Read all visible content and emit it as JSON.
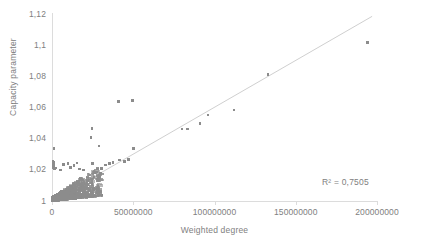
{
  "chart_data": {
    "type": "scatter",
    "title": "",
    "xlabel": "Weighted degree",
    "ylabel": "Capacity parameter",
    "xlim": [
      0,
      200000000
    ],
    "ylim": [
      1,
      1.12
    ],
    "grid": false,
    "legend": null,
    "xticklabels": [
      "0",
      "50000000",
      "100000000",
      "150000000",
      "200000000"
    ],
    "xtickvalues": [
      0,
      50000000,
      100000000,
      150000000,
      200000000
    ],
    "yticklabels": [
      "1",
      "1,02",
      "1,04",
      "1,06",
      "1,08",
      "1,1",
      "1,12"
    ],
    "ytickvalues": [
      1,
      1.02,
      1.04,
      1.06,
      1.08,
      1.1,
      1.12
    ],
    "annotations": [
      {
        "text": "R² = 0,7505",
        "x": 160000000,
        "y": 1.013
      }
    ],
    "trendline": {
      "type": "linear",
      "r_squared": 0.7505,
      "x_start": 0,
      "y_start": 1.0,
      "x_end": 197000000,
      "y_end": 1.1185
    },
    "marker_color": "#8c8c8c",
    "trendline_color": "#c9c9c9",
    "axis_color": "#dcdcdc",
    "series": [
      {
        "name": "Capacity parameter vs Weighted degree",
        "points": [
          [
            1200000,
            1.0335
          ],
          [
            700000,
            1.0255
          ],
          [
            900000,
            1.0248
          ],
          [
            800000,
            1.0228
          ],
          [
            600000,
            1.0222
          ],
          [
            1000000,
            1.0215
          ],
          [
            1500000,
            1.0205
          ],
          [
            2400000,
            1.0212
          ],
          [
            5200000,
            1.02
          ],
          [
            7200000,
            1.0235
          ],
          [
            9800000,
            1.0241
          ],
          [
            11500000,
            1.0215
          ],
          [
            13500000,
            1.0228
          ],
          [
            15500000,
            1.0243
          ],
          [
            17000000,
            1.0205
          ],
          [
            19500000,
            1.0198
          ],
          [
            24500000,
            1.0465
          ],
          [
            24000000,
            1.0408
          ],
          [
            24800000,
            1.0242
          ],
          [
            29000000,
            1.0352
          ],
          [
            28000000,
            1.0205
          ],
          [
            30500000,
            1.0208
          ],
          [
            33000000,
            1.0232
          ],
          [
            35500000,
            1.024
          ],
          [
            37500000,
            1.0248
          ],
          [
            41000000,
            1.064
          ],
          [
            49500000,
            1.0645
          ],
          [
            41500000,
            1.0262
          ],
          [
            44500000,
            1.0253
          ],
          [
            47000000,
            1.0268
          ],
          [
            50000000,
            1.0335
          ],
          [
            80000000,
            1.0462
          ],
          [
            83500000,
            1.0463
          ],
          [
            91000000,
            1.0497
          ],
          [
            96000000,
            1.0553
          ],
          [
            112000000,
            1.0585
          ],
          [
            133000000,
            1.0812
          ],
          [
            194000000,
            1.1018
          ]
        ]
      }
    ]
  },
  "axes": {
    "y_title": "Capacity parameter",
    "x_title": "Weighted degree"
  }
}
